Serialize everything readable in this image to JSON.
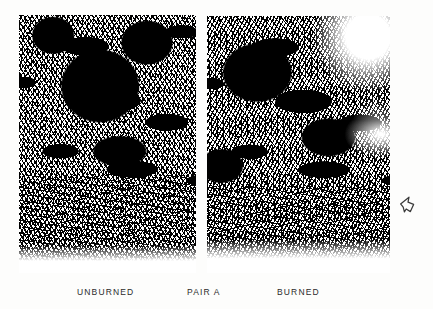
{
  "figure": {
    "name": "paired-forest-photographs",
    "background_color": "#fdfdfc",
    "ink_color": "#000000",
    "photos": [
      {
        "id": "photo-unburned",
        "alt_label": "UNBURNED",
        "description": "High-contrast black-and-white photograph of a dense conifer stand with deep shaded canopy mass at upper center and pale slash and downed woody debris across the forest floor in the lower third.",
        "position": {
          "left": 19,
          "top": 15,
          "width": 177,
          "height": 258
        }
      },
      {
        "id": "photo-burned",
        "alt_label": "BURNED",
        "description": "High-contrast black-and-white photograph of a conifer stand after burning, with a pale vertical trunk at upper right, brighter washed-out sky area at top right, and a swept, cleared forest floor in the lower third.",
        "position": {
          "left": 207,
          "top": 16,
          "width": 183,
          "height": 257
        }
      }
    ]
  },
  "captions": {
    "left_label": "UNBURNED",
    "center_label": "PAIR A",
    "right_label": "BURNED"
  },
  "annotation": {
    "arrow": {
      "icon_name": "arrow-outline-icon",
      "description": "Small hand-drawn outlined arrow/pennant pointing left, in the right margin beside the burned photograph."
    }
  }
}
